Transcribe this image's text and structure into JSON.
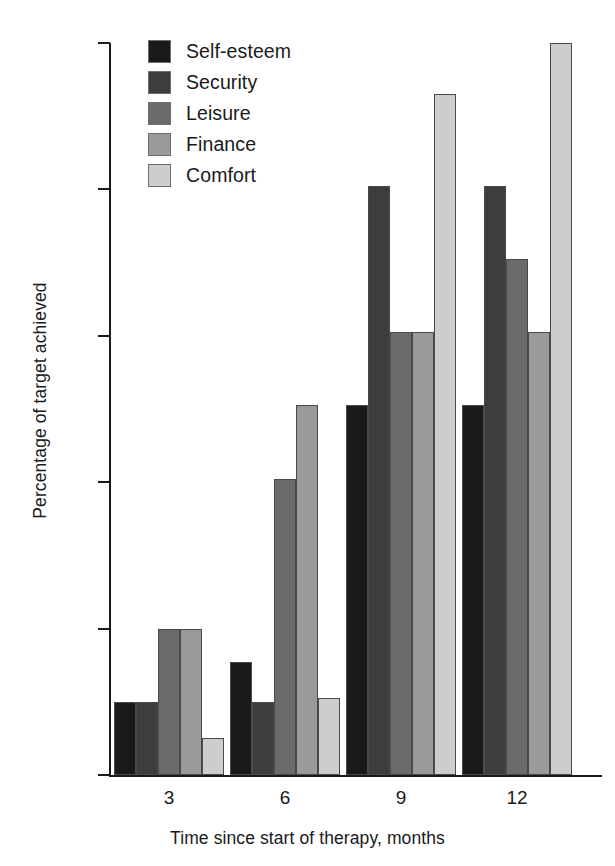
{
  "chart_data": {
    "type": "bar",
    "title": "",
    "xlabel": "Time since start of therapy, months",
    "ylabel": "Percentage of target achieved",
    "categories": [
      "3",
      "6",
      "9",
      "12"
    ],
    "ylim": [
      0,
      100
    ],
    "yticks": [
      0,
      20,
      40,
      60,
      80,
      100
    ],
    "grid": false,
    "legend_position": "top-left",
    "series": [
      {
        "name": "Self-esteem",
        "color": "#1a1a1a",
        "values": [
          10,
          15.5,
          50.5,
          50.5
        ]
      },
      {
        "name": "Security",
        "color": "#3d3d3d",
        "values": [
          10,
          10,
          80.5,
          80.5
        ]
      },
      {
        "name": "Leisure",
        "color": "#6b6b6b",
        "values": [
          20,
          40.5,
          60.5,
          70.5
        ]
      },
      {
        "name": "Finance",
        "color": "#9a9a9a",
        "values": [
          20,
          50.5,
          60.5,
          60.5
        ]
      },
      {
        "name": "Comfort",
        "color": "#cdcdcd",
        "values": [
          5,
          10.5,
          93,
          100
        ]
      }
    ]
  },
  "axis": {
    "ytick_labels": [
      "0",
      "20",
      "40",
      "60",
      "80",
      "100"
    ],
    "xtick_labels": [
      "3",
      "6",
      "9",
      "12"
    ]
  },
  "legend": {
    "items": [
      {
        "label": "Self-esteem"
      },
      {
        "label": "Security"
      },
      {
        "label": "Leisure"
      },
      {
        "label": "Finance"
      },
      {
        "label": "Comfort"
      }
    ]
  }
}
